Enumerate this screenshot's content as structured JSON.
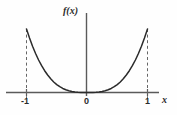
{
  "figure": {
    "name": "function-plot",
    "background_color": "#fefefe",
    "line_color": "#2b2b2b",
    "axis_color": "#555555",
    "dash_color": "#666666"
  },
  "labels": {
    "y_axis": "f(x)",
    "x_axis": "x",
    "tick_neg_one": "-1",
    "tick_zero": "0",
    "tick_one": "1"
  },
  "chart_data": {
    "type": "line",
    "title": "",
    "xlabel": "x",
    "ylabel": "f(x)",
    "xlim": [
      -1.25,
      1.25
    ],
    "ylim": [
      0,
      1.15
    ],
    "grid": false,
    "legend": null,
    "xticks": [
      -1,
      0,
      1
    ],
    "xticklabels": [
      "-1",
      "0",
      "1"
    ],
    "yticks": [],
    "yticklabels": [],
    "annotations": [
      {
        "type": "dashed-vline",
        "x": -1,
        "y0": 0,
        "y1": 1.0
      },
      {
        "type": "dashed-vline",
        "x": 1,
        "y0": 0,
        "y1": 1.0
      }
    ],
    "series": [
      {
        "name": "f(x)",
        "x": [
          -1.0,
          -0.95,
          -0.9,
          -0.85,
          -0.8,
          -0.75,
          -0.7,
          -0.65,
          -0.6,
          -0.55,
          -0.5,
          -0.45,
          -0.4,
          -0.35,
          -0.3,
          -0.25,
          -0.2,
          -0.15,
          -0.1,
          -0.05,
          0.0,
          0.05,
          0.1,
          0.15,
          0.2,
          0.25,
          0.3,
          0.35,
          0.4,
          0.45,
          0.5,
          0.55,
          0.6,
          0.65,
          0.7,
          0.75,
          0.8,
          0.85,
          0.9,
          0.95,
          1.0
        ],
        "y": [
          1.0,
          0.857,
          0.729,
          0.614,
          0.512,
          0.422,
          0.343,
          0.275,
          0.216,
          0.166,
          0.125,
          0.091,
          0.064,
          0.043,
          0.027,
          0.016,
          0.008,
          0.003,
          0.001,
          0.0,
          0.0,
          0.0,
          0.001,
          0.003,
          0.008,
          0.016,
          0.027,
          0.043,
          0.064,
          0.091,
          0.125,
          0.166,
          0.216,
          0.275,
          0.343,
          0.422,
          0.512,
          0.614,
          0.729,
          0.857,
          1.0
        ]
      }
    ]
  }
}
